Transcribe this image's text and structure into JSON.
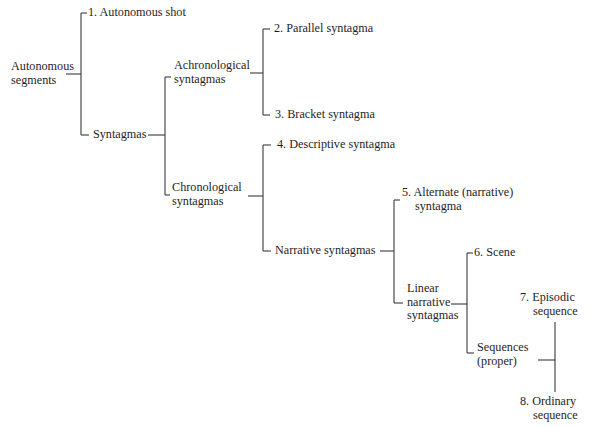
{
  "diagram": {
    "type": "tree",
    "root": {
      "line1": "Autonomous",
      "line2": "segments"
    },
    "nodes": {
      "n1": {
        "line1": "1. Autonomous shot"
      },
      "syntagmas": {
        "line1": "Syntagmas"
      },
      "achronological": {
        "line1": "Achronological",
        "line2": "syntagmas"
      },
      "n2": {
        "line1": "2. Parallel syntagma"
      },
      "n3": {
        "line1": "3. Bracket syntagma"
      },
      "chronological": {
        "line1": "Chronological",
        "line2": "syntagmas"
      },
      "n4": {
        "line1": "4. Descriptive syntagma"
      },
      "narrative": {
        "line1": "Narrative syntagmas"
      },
      "n5": {
        "line1": "5. Alternate (narrative)",
        "line2": "syntagma"
      },
      "linear": {
        "line1": "Linear",
        "line2": "narrative",
        "line3": "syntagmas"
      },
      "n6": {
        "line1": "6. Scene"
      },
      "sequences": {
        "line1": "Sequences",
        "line2": "(proper)"
      },
      "n7": {
        "line1": "7. Episodic",
        "line2": "sequence"
      },
      "n8": {
        "line1": "8. Ordinary",
        "line2": "sequence"
      }
    },
    "edges": [
      [
        "root",
        "n1"
      ],
      [
        "root",
        "syntagmas"
      ],
      [
        "syntagmas",
        "achronological"
      ],
      [
        "syntagmas",
        "chronological"
      ],
      [
        "achronological",
        "n2"
      ],
      [
        "achronological",
        "n3"
      ],
      [
        "chronological",
        "n4"
      ],
      [
        "chronological",
        "narrative"
      ],
      [
        "narrative",
        "n5"
      ],
      [
        "narrative",
        "linear"
      ],
      [
        "linear",
        "n6"
      ],
      [
        "linear",
        "sequences"
      ],
      [
        "sequences",
        "n7"
      ],
      [
        "sequences",
        "n8"
      ]
    ],
    "colors": {
      "line": "#3a3a3a",
      "text": "#1e1e1e",
      "background": "#ffffff"
    }
  }
}
